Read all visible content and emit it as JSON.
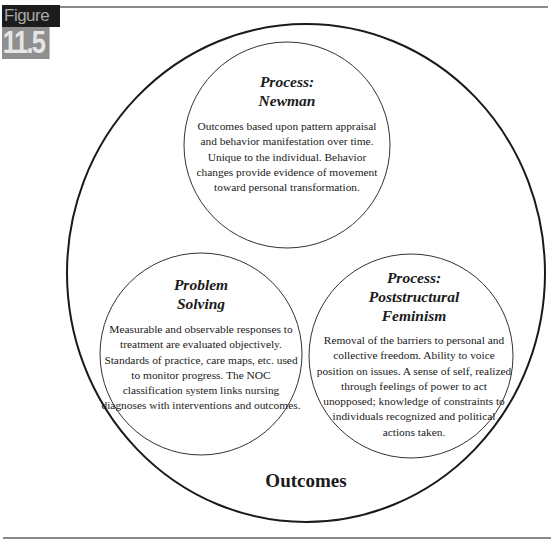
{
  "figure": {
    "label": "Figure",
    "number": "11.5"
  },
  "diagram": {
    "outer_label": "Outcomes",
    "nodes": [
      {
        "id": "newman",
        "title_line1": "Process:",
        "title_line2": "Newman",
        "title_line3": "",
        "body": "Outcomes based upon pattern appraisal and behavior manifestation over time. Unique to the individual. Behavior changes provide evidence of movement toward personal transformation."
      },
      {
        "id": "problem-solving",
        "title_line1": "Problem",
        "title_line2": "Solving",
        "title_line3": "",
        "body": "Measurable and observable responses to treatment are evaluated objectively. Standards of practice, care maps, etc. used to monitor progress. The NOC classification system links nursing diagnoses with interventions and outcomes."
      },
      {
        "id": "poststructural-feminism",
        "title_line1": "Process:",
        "title_line2": "Poststructural",
        "title_line3": "Feminism",
        "body": "Removal of the barriers to personal and collective freedom. Ability to voice position on issues. A sense of self, realized through feelings of power to act unopposed; knowledge of constraints to individuals recognized and political actions taken."
      }
    ]
  },
  "colors": {
    "line": "#1a1a1a",
    "rule": "#8a8a8a",
    "badge_dark": "#1c1c1c",
    "badge_gray": "#8f8f8f"
  }
}
